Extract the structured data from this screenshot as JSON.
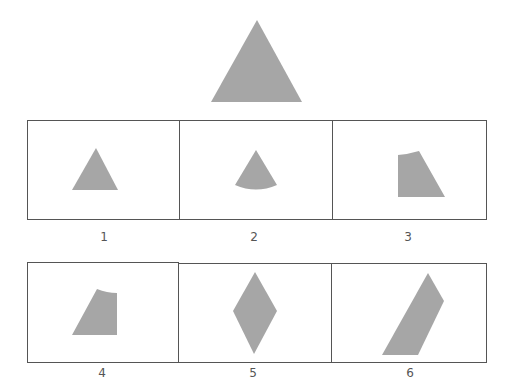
{
  "question": {
    "reference_shape": "equilateral-triangle",
    "colors": {
      "fill": "#a6a6a6",
      "border": "#555555",
      "label": "#555555"
    }
  },
  "options": [
    {
      "label": "1",
      "shape": "triangle"
    },
    {
      "label": "2",
      "shape": "circular-sector"
    },
    {
      "label": "3",
      "shape": "truncated-triangle-right"
    },
    {
      "label": "4",
      "shape": "truncated-triangle-left"
    },
    {
      "label": "5",
      "shape": "rhombus"
    },
    {
      "label": "6",
      "shape": "parallelogram-slanted"
    }
  ]
}
